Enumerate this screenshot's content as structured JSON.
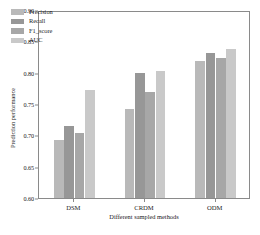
{
  "chart_data": {
    "type": "bar",
    "title": "",
    "subtitle": "",
    "xlabel": "Different sampled methods",
    "ylabel": "Prediction performance",
    "categories": [
      "DSM",
      "CRDM",
      "ODM"
    ],
    "series": [
      {
        "name": "Precision",
        "values": [
          0.693,
          0.742,
          0.818
        ],
        "color": "#b9b9b9"
      },
      {
        "name": "Recall",
        "values": [
          0.715,
          0.8,
          0.831
        ],
        "color": "#979797"
      },
      {
        "name": "F1_score",
        "values": [
          0.703,
          0.769,
          0.824
        ],
        "color": "#a7a7a7"
      },
      {
        "name": "AUC",
        "values": [
          0.772,
          0.802,
          0.838
        ],
        "color": "#c9c9c9"
      }
    ],
    "ylim": [
      0.6,
      0.9
    ],
    "yticks": [
      "0.60",
      "0.65",
      "0.70",
      "0.75",
      "0.80",
      "0.85",
      "0.90"
    ],
    "ytick_values": [
      0.6,
      0.65,
      0.7,
      0.75,
      0.8,
      0.85,
      0.9
    ],
    "grid": false,
    "legend_position": "upper left",
    "legend_entries": [
      "Precision",
      "Recall",
      "F1_score",
      "AUC"
    ]
  },
  "axes": {
    "frame_color": "#8a8a8a"
  }
}
